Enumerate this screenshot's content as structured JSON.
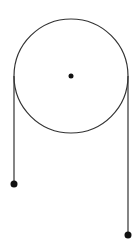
{
  "diagram": {
    "type": "pulley",
    "background": "#ffffff",
    "stroke_color": "#333333",
    "dot_color": "#111111",
    "pulley": {
      "cx": 71,
      "cy": 76,
      "r": 57
    },
    "axle": {
      "cx": 71,
      "cy": 76,
      "r": 2.5
    },
    "left_rope": {
      "x": 14,
      "y1": 76,
      "y2": 184
    },
    "right_rope": {
      "x": 128,
      "y1": 76,
      "y2": 235
    },
    "left_mass": {
      "cx": 14,
      "cy": 184,
      "r": 3.5
    },
    "right_mass": {
      "cx": 128,
      "cy": 235,
      "r": 3.5
    }
  }
}
